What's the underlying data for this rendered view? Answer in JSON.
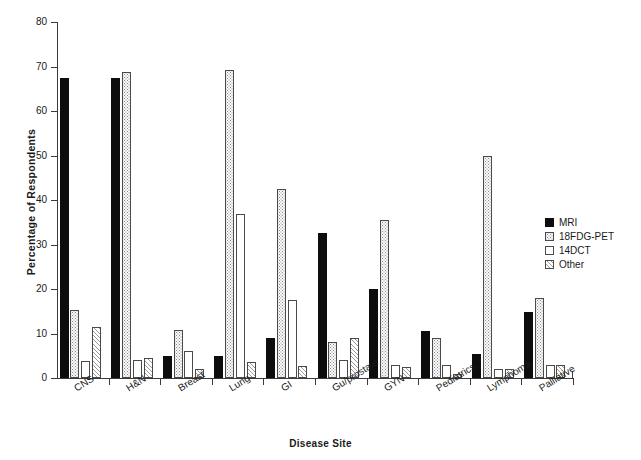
{
  "chart_data": {
    "type": "bar",
    "title": "",
    "xlabel": "Disease Site",
    "ylabel": "Percentage of Respondents",
    "ylim": [
      0,
      80
    ],
    "yticks": [
      0,
      10,
      20,
      30,
      40,
      50,
      60,
      70,
      80
    ],
    "grid": false,
    "legend_position": "right-middle",
    "categories": [
      "CNS",
      "H&N",
      "Breast",
      "Lung",
      "GI",
      "Gu/prostate",
      "GYN",
      "Pediatrics",
      "Lymphoma",
      "Palliative"
    ],
    "series": [
      {
        "name": "MRI",
        "pattern": "solid-black",
        "color": "#0d0d0d",
        "values": [
          67.5,
          67.5,
          5.0,
          5.0,
          9.0,
          32.5,
          20.0,
          10.5,
          5.5,
          14.8
        ]
      },
      {
        "name": "18FDG-PET",
        "pattern": "dotted",
        "color": "#fbfbfb",
        "values": [
          15.2,
          68.8,
          10.8,
          69.2,
          42.5,
          8.0,
          35.5,
          9.0,
          50.0,
          18.0
        ]
      },
      {
        "name": "14DCT",
        "pattern": "empty",
        "color": "#ffffff",
        "values": [
          3.8,
          4.0,
          6.0,
          36.8,
          17.5,
          4.0,
          3.0,
          3.0,
          2.0,
          3.0
        ]
      },
      {
        "name": "Other",
        "pattern": "diagonal-hatch",
        "color": "#ffffff",
        "values": [
          11.5,
          4.5,
          2.0,
          3.5,
          2.8,
          9.0,
          2.5,
          0.8,
          2.0,
          3.0
        ]
      }
    ]
  },
  "legend": {
    "items": [
      {
        "label": "MRI",
        "pattern": "mri"
      },
      {
        "label": "18FDG-PET",
        "pattern": "pet"
      },
      {
        "label": "14DCT",
        "pattern": "dct"
      },
      {
        "label": "Other",
        "pattern": "other"
      }
    ]
  }
}
